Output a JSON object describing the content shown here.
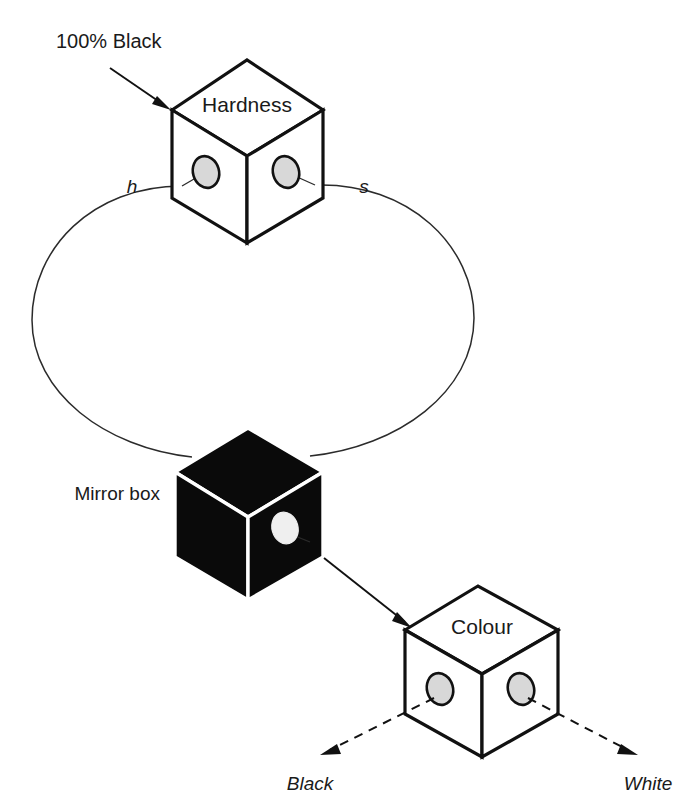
{
  "figure": {
    "background_color": "#ffffff",
    "line_color": "#1a1a1a",
    "hole_fill_color": "#d8d8d8",
    "black_box_color": "#0a0a0a"
  },
  "labels": {
    "callout_top": "100% Black",
    "cube_top_title": "Hardness",
    "cube_top_left_port": "h",
    "cube_top_right_port": "s",
    "cube_middle_title": "Mirror box",
    "cube_bottom_title": "Colour",
    "axis_left": "Black",
    "axis_right": "White"
  },
  "nodes": [
    {
      "id": "hardness-cube",
      "label": "Hardness",
      "style": "white",
      "ports": [
        "h",
        "s"
      ],
      "hole_count": 2
    },
    {
      "id": "mirror-box-cube",
      "label": "Mirror box",
      "style": "black",
      "ports": [],
      "hole_count": 1
    },
    {
      "id": "colour-cube",
      "label": "Colour",
      "style": "white",
      "ports": [
        "Black",
        "White"
      ],
      "hole_count": 2
    }
  ],
  "connectors": [
    {
      "id": "callout-arrow",
      "from": "100% Black",
      "to": "hardness-cube",
      "style": "solid-arrow"
    },
    {
      "id": "loop-left",
      "from": "hardness-cube.h",
      "to": "mirror-box-cube",
      "style": "thin-curve"
    },
    {
      "id": "loop-right",
      "from": "hardness-cube.s",
      "to": "mirror-box-cube",
      "style": "thin-curve"
    },
    {
      "id": "mirror-to-colour",
      "from": "mirror-box-cube",
      "to": "colour-cube",
      "style": "solid-arrow"
    },
    {
      "id": "colour-to-black",
      "from": "colour-cube",
      "to": "Black",
      "style": "dashed-arrow"
    },
    {
      "id": "colour-to-white",
      "from": "colour-cube",
      "to": "White",
      "style": "dashed-arrow"
    }
  ]
}
